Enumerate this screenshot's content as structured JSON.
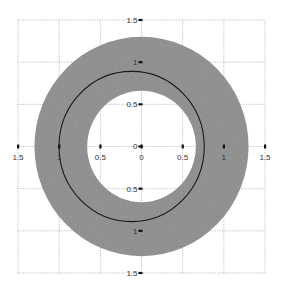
{
  "chart_data": {
    "type": "scatter",
    "title": "",
    "xlabel": "",
    "ylabel": "",
    "xlim": [
      -1.5,
      1.5
    ],
    "ylim": [
      -1.5,
      1.5
    ],
    "grid": true,
    "grid_style": "dotted",
    "axes_style": "centered",
    "x_ticks": [
      -1.5,
      -1,
      -0.5,
      0,
      0.5,
      1,
      1.5
    ],
    "x_tick_labels": [
      "1.5",
      "1",
      "0.5",
      "0",
      "0.5",
      "1",
      "1.5"
    ],
    "y_ticks": [
      1.5,
      1,
      0.5,
      0,
      -0.5,
      -1,
      -1.5
    ],
    "y_tick_labels": [
      "1.5",
      "1",
      "0.5",
      "0",
      "0.5",
      "1",
      "1.5"
    ],
    "shapes": [
      {
        "name": "annulus",
        "kind": "filled-ring",
        "center": [
          0,
          0
        ],
        "outer_radius": 1.3,
        "inner_radius": 0.66,
        "fill": "#8c8c8c"
      },
      {
        "name": "circle",
        "kind": "circle-outline",
        "center": [
          -0.12,
          0
        ],
        "radius": 0.9,
        "stroke": "#1a1a1a"
      }
    ],
    "legend": null
  },
  "colors": {
    "ring_fill": "#8c8c8c",
    "circle_stroke": "#1a1a1a",
    "grid": "#b0b0b0",
    "tick": "#111111"
  }
}
